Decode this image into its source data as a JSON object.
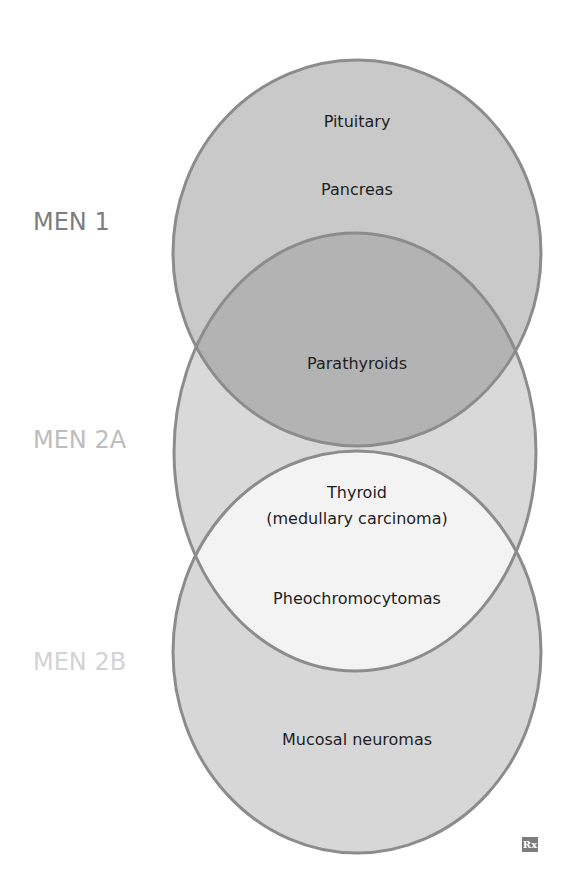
{
  "diagram": {
    "type": "venn",
    "sets": [
      {
        "id": "men1",
        "label": "MEN 1",
        "label_color": "#7d7d7d",
        "fill": "#c9c9c9"
      },
      {
        "id": "men2a",
        "label": "MEN 2A",
        "label_color": "#bdbdbd",
        "fill": "#d9d9d9"
      },
      {
        "id": "men2b",
        "label": "MEN 2B",
        "label_color": "#d3d3d3",
        "fill": "#d7d7d7"
      }
    ],
    "stroke_color": "#8c8c8c",
    "overlap_fills": {
      "men1_men2a": "#b3b3b3",
      "men2a_men2b": "#f3f3f3"
    },
    "regions": {
      "men1_only": [
        "Pituitary",
        "Pancreas"
      ],
      "men1_men2a": [
        "Parathyroids"
      ],
      "men2a_men2b": {
        "thyroid_line1": "Thyroid",
        "thyroid_line2": "(medullary carcinoma)",
        "pheo": "Pheochromocytomas"
      },
      "men2b_only": [
        "Mucosal neuromas"
      ]
    },
    "logo": "Rx"
  }
}
